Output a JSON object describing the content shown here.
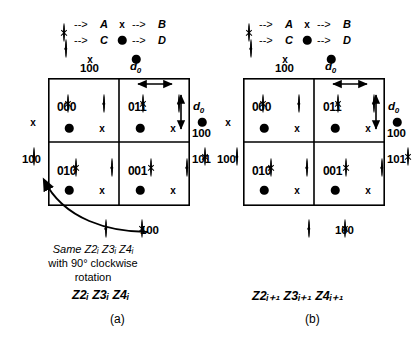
{
  "figure": {
    "caption_a": "(a)",
    "caption_b": "(b)",
    "panel_a_title": "Z2ᵢ Z3ᵢ Z4ᵢ",
    "panel_b_title": "Z2ᵢ₊₁ Z3ᵢ₊₁ Z4ᵢ₊₁",
    "rotation_note_line1": "Same  Z2ᵢ  Z3ᵢ   Z4ᵢ",
    "rotation_note_line2": "with 90° clockwise",
    "rotation_note_line3": "rotation"
  },
  "legend": {
    "arrow": "-->",
    "entries": [
      {
        "symbol": "crossed-circle",
        "arrow": "-->",
        "label": "A"
      },
      {
        "symbol": "x-mark",
        "arrow": "-->",
        "label": "B"
      },
      {
        "symbol": "dotted-circle",
        "arrow": "-->",
        "label": "C"
      },
      {
        "symbol": "filled-circle",
        "arrow": "-->",
        "label": "D"
      }
    ]
  },
  "dimension_labels": {
    "horizontal": "d",
    "horizontal_sub": "0",
    "vertical": "d",
    "vertical_sub": "0"
  },
  "panels": [
    {
      "id": "a",
      "cells": [
        {
          "position": "top-left",
          "id": "000",
          "symbols": [
            "crossed-circle",
            "dotted-circle",
            "filled-circle",
            "x-mark"
          ]
        },
        {
          "position": "top-right",
          "id": "011",
          "symbols": [
            "crossed-circle",
            "dotted-circle",
            "filled-circle",
            "x-mark"
          ]
        },
        {
          "position": "bottom-left",
          "id": "010",
          "symbols": [
            "crossed-circle",
            "dotted-circle",
            "filled-circle",
            "x-mark"
          ]
        },
        {
          "position": "bottom-right",
          "id": "001",
          "symbols": [
            "crossed-circle",
            "dotted-circle",
            "filled-circle",
            "x-mark"
          ]
        }
      ],
      "outside": [
        {
          "place": "top-left",
          "symbol": "x-mark",
          "label": "100"
        },
        {
          "place": "top-right",
          "symbol": "filled-circle",
          "label": ""
        },
        {
          "place": "left-upper",
          "symbol": "x-mark",
          "label": ""
        },
        {
          "place": "left-lower",
          "symbol": "dotted-circle",
          "label": "100"
        },
        {
          "place": "right-upper",
          "symbol": "filled-circle",
          "label": "100"
        },
        {
          "place": "right-lower",
          "symbol": "crossed-circle",
          "label": "101"
        },
        {
          "place": "bottom-left",
          "symbol": "dotted-circle",
          "label": ""
        },
        {
          "place": "bottom-right",
          "symbol": "crossed-circle",
          "label": "100"
        }
      ]
    },
    {
      "id": "b",
      "cells": [
        {
          "position": "top-left",
          "id": "000",
          "symbols": [
            "crossed-circle",
            "dotted-circle",
            "filled-circle",
            "x-mark"
          ]
        },
        {
          "position": "top-right",
          "id": "011",
          "symbols": [
            "crossed-circle",
            "dotted-circle",
            "filled-circle",
            "x-mark"
          ]
        },
        {
          "position": "bottom-left",
          "id": "010",
          "symbols": [
            "crossed-circle",
            "dotted-circle",
            "filled-circle",
            "x-mark"
          ]
        },
        {
          "position": "bottom-right",
          "id": "001",
          "symbols": [
            "crossed-circle",
            "dotted-circle",
            "filled-circle",
            "x-mark"
          ]
        }
      ],
      "outside": [
        {
          "place": "top-left",
          "symbol": "x-mark",
          "label": "100"
        },
        {
          "place": "top-right",
          "symbol": "filled-circle",
          "label": ""
        },
        {
          "place": "left-upper",
          "symbol": "x-mark",
          "label": ""
        },
        {
          "place": "left-lower",
          "symbol": "dotted-circle",
          "label": "100"
        },
        {
          "place": "right-upper",
          "symbol": "filled-circle",
          "label": "100"
        },
        {
          "place": "right-lower",
          "symbol": "crossed-circle",
          "label": "101"
        },
        {
          "place": "bottom-left",
          "symbol": "dotted-circle",
          "label": ""
        },
        {
          "place": "bottom-right",
          "symbol": "crossed-circle",
          "label": "100"
        }
      ]
    }
  ]
}
